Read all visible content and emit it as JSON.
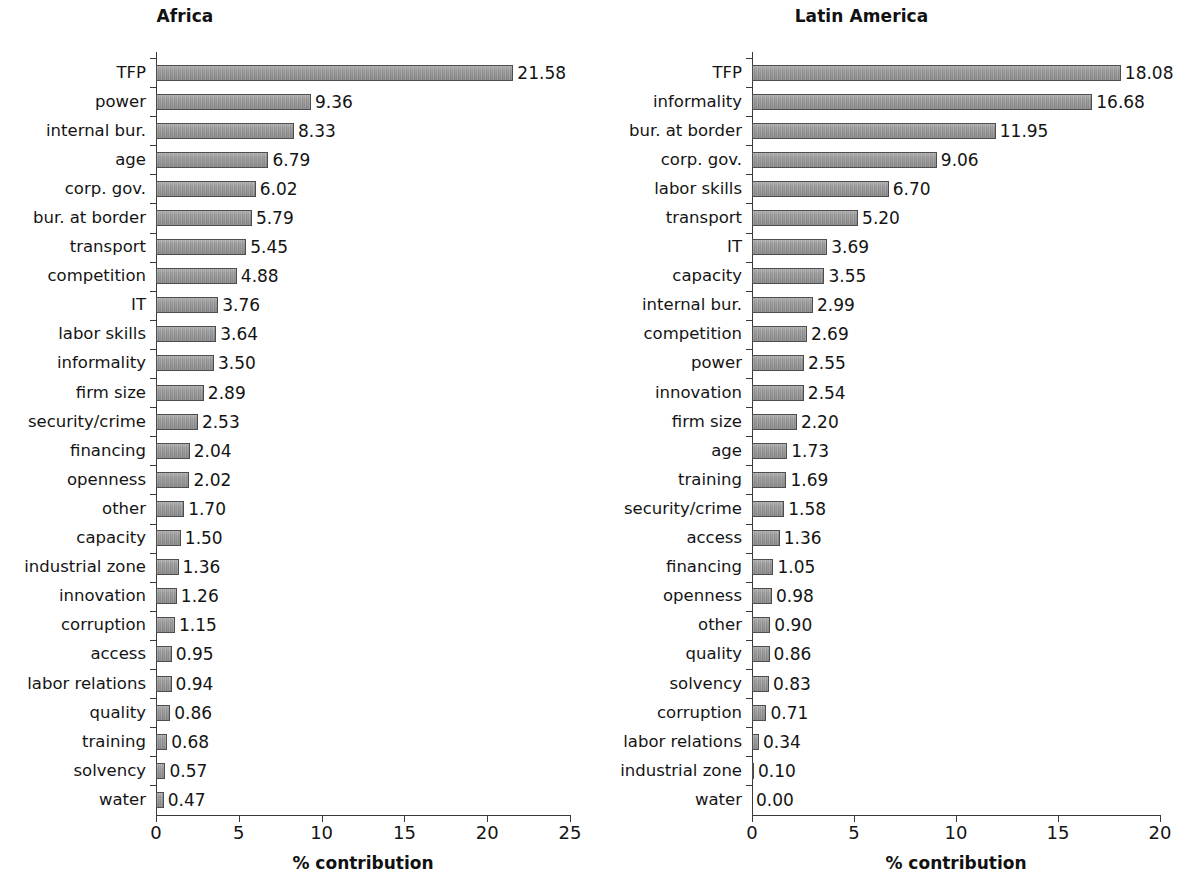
{
  "figure": {
    "background": "#ffffff",
    "bar_fill": "#9b9b9b",
    "bar_edge": "#4d4d4d",
    "text_color": "#141414"
  },
  "chart_data": [
    {
      "type": "bar",
      "orientation": "horizontal",
      "title": "Africa",
      "xlabel": "% contribution",
      "ylabel": "",
      "xlim": [
        0,
        25
      ],
      "xticks": [
        0,
        5,
        10,
        15,
        20,
        25
      ],
      "xtick_labels": [
        "0",
        "5",
        "10",
        "15",
        "20",
        "25"
      ],
      "grid": false,
      "legend": null,
      "value_label_format": "0.00",
      "categories": [
        "TFP",
        "power",
        "internal bur.",
        "age",
        "corp. gov.",
        "bur. at border",
        "transport",
        "competition",
        "IT",
        "labor skills",
        "informality",
        "firm size",
        "security/crime",
        "financing",
        "openness",
        "other",
        "capacity",
        "industrial zone",
        "innovation",
        "corruption",
        "access",
        "labor relations",
        "quality",
        "training",
        "solvency",
        "water"
      ],
      "values": [
        21.58,
        9.36,
        8.33,
        6.79,
        6.02,
        5.79,
        5.45,
        4.88,
        3.76,
        3.64,
        3.5,
        2.89,
        2.53,
        2.04,
        2.02,
        1.7,
        1.5,
        1.36,
        1.26,
        1.15,
        0.95,
        0.94,
        0.86,
        0.68,
        0.57,
        0.47
      ],
      "value_labels": [
        "21.58",
        "9.36",
        "8.33",
        "6.79",
        "6.02",
        "5.79",
        "5.45",
        "4.88",
        "3.76",
        "3.64",
        "3.50",
        "2.89",
        "2.53",
        "2.04",
        "2.02",
        "1.70",
        "1.50",
        "1.36",
        "1.26",
        "1.15",
        "0.95",
        "0.94",
        "0.86",
        "0.68",
        "0.57",
        "0.47"
      ]
    },
    {
      "type": "bar",
      "orientation": "horizontal",
      "title": "Latin America",
      "xlabel": "% contribution",
      "ylabel": "",
      "xlim": [
        0,
        20
      ],
      "xticks": [
        0,
        5,
        10,
        15,
        20
      ],
      "xtick_labels": [
        "0",
        "5",
        "10",
        "15",
        "20"
      ],
      "grid": false,
      "legend": null,
      "value_label_format": "0.00",
      "categories": [
        "TFP",
        "informality",
        "bur. at border",
        "corp. gov.",
        "labor skills",
        "transport",
        "IT",
        "capacity",
        "internal bur.",
        "competition",
        "power",
        "innovation",
        "firm size",
        "age",
        "training",
        "security/crime",
        "access",
        "financing",
        "openness",
        "other",
        "quality",
        "solvency",
        "corruption",
        "labor relations",
        "industrial zone",
        "water"
      ],
      "values": [
        18.08,
        16.68,
        11.95,
        9.06,
        6.7,
        5.2,
        3.69,
        3.55,
        2.99,
        2.69,
        2.55,
        2.54,
        2.2,
        1.73,
        1.69,
        1.58,
        1.36,
        1.05,
        0.98,
        0.9,
        0.86,
        0.83,
        0.71,
        0.34,
        0.1,
        0.0
      ],
      "value_labels": [
        "18.08",
        "16.68",
        "11.95",
        "9.06",
        "6.70",
        "5.20",
        "3.69",
        "3.55",
        "2.99",
        "2.69",
        "2.55",
        "2.54",
        "2.20",
        "1.73",
        "1.69",
        "1.58",
        "1.36",
        "1.05",
        "0.98",
        "0.90",
        "0.86",
        "0.83",
        "0.71",
        "0.34",
        "0.10",
        "0.00"
      ]
    }
  ]
}
